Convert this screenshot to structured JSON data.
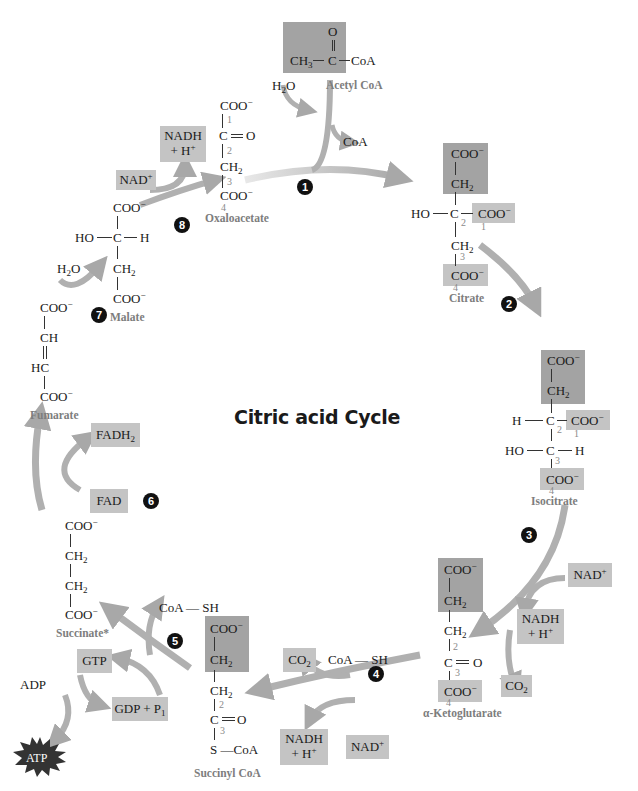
{
  "title": "Citric acid Cycle",
  "colors": {
    "box_dark": "#a3a3a3",
    "box_light": "#c4c4c4",
    "arrow": "#b5b5b5",
    "label": "#7d7d7d",
    "step_badge": "#111111"
  },
  "steps": [
    "1",
    "2",
    "3",
    "4",
    "5",
    "6",
    "7",
    "8"
  ],
  "acetyl_coa": {
    "name": "Acetyl CoA",
    "o": "O",
    "ch3": "CH",
    "ch3_sub": "3",
    "c": "C",
    "coa": "CoA",
    "h2o": "H",
    "h2o_sub": "2",
    "h2o_o": "O",
    "coa_out": "CoA"
  },
  "oxaloacetate": {
    "name": "Oxaloacetate",
    "coo1": "COO",
    "c": "C",
    "o": "O",
    "ch2": "CH",
    "coo4": "COO",
    "nums": [
      "1",
      "2",
      "3",
      "4"
    ],
    "nadh": "NADH",
    "h_plus": "+ H",
    "nad": "NAD"
  },
  "citrate": {
    "name": "Citrate",
    "coo_top": "COO",
    "ch2": "CH",
    "ho": "HO",
    "c": "C",
    "coo1": "COO",
    "ch2b": "CH",
    "coo4": "COO",
    "nums": [
      "1",
      "2",
      "3",
      "4"
    ]
  },
  "isocitrate": {
    "name": "Isocitrate",
    "coo_top": "COO",
    "ch2": "CH",
    "h": "H",
    "c2": "C",
    "coo1": "COO",
    "ho": "HO",
    "c3": "C",
    "h2": "H",
    "coo4": "COO",
    "nums": [
      "1",
      "2",
      "3",
      "4"
    ]
  },
  "ketoglutarate": {
    "name": "α-Ketoglutarate",
    "coo_top": "COO",
    "ch2a": "CH",
    "ch2b": "CH",
    "c": "C",
    "o": "O",
    "coo4": "COO",
    "nums": [
      "2",
      "3",
      "4"
    ],
    "nad": "NAD",
    "nadh": "NADH",
    "h_plus": "+ H",
    "co2": "CO"
  },
  "succinyl_coa": {
    "name": "Succinyl CoA",
    "coo_top": "COO",
    "ch2a": "CH",
    "ch2b": "CH",
    "c": "C",
    "o": "O",
    "s_coa": "S —CoA",
    "nums": [
      "2",
      "3"
    ],
    "co2": "CO",
    "coa_sh": "CoA — SH",
    "nadh": "NADH",
    "h_plus": "+ H",
    "nad": "NAD"
  },
  "succinate": {
    "name": "Succinate*",
    "coo1": "COO",
    "ch2a": "CH",
    "ch2b": "CH",
    "coo4": "COO",
    "coa_sh": "CoA — SH",
    "gtp": "GTP",
    "gdp": "GDP + P",
    "gdp_sub": "1",
    "adp": "ADP",
    "atp": "ATP"
  },
  "fumarate": {
    "name": "Fumarate",
    "coo1": "COO",
    "ch": "CH",
    "hc": "HC",
    "coo4": "COO",
    "fad": "FAD",
    "fadh2": "FADH",
    "fadh2_sub": "2"
  },
  "malate": {
    "name": "Malate",
    "coo1": "COO",
    "ho": "HO",
    "c": "C",
    "h": "H",
    "ch2": "CH",
    "coo4": "COO",
    "h2o": "H",
    "h2o_sub": "2",
    "h2o_o": "O"
  },
  "charges": {
    "minus": "−",
    "plus": "+",
    "sub2": "2",
    "sub3": "3"
  }
}
